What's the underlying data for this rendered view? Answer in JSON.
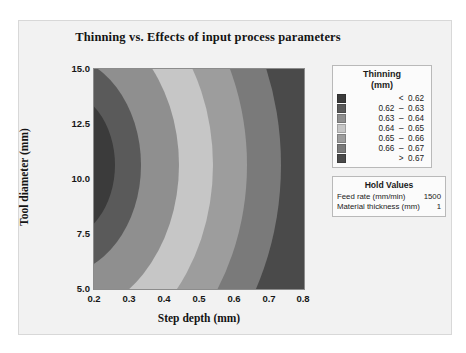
{
  "chart_data": {
    "type": "heatmap",
    "subtype": "filled-contour",
    "title": "Thinning vs. Effects of input process parameters",
    "xlabel": "Step depth (mm)",
    "ylabel": "Tool diameter (mm)",
    "xlim": [
      0.2,
      0.8
    ],
    "ylim": [
      5.0,
      15.0
    ],
    "xticks": [
      "0.2",
      "0.3",
      "0.4",
      "0.5",
      "0.6",
      "0.7",
      "0.8"
    ],
    "yticks": [
      "5.0",
      "7.5",
      "10.0",
      "12.5",
      "15.0"
    ],
    "grid": false,
    "legend_position": "right",
    "response": "Thinning",
    "response_unit": "(mm)",
    "levels": [
      {
        "label": "<  0.62",
        "range": [
          null,
          0.62
        ],
        "color": "#3b3b3b"
      },
      {
        "label": "0.62  –  0.63",
        "range": [
          0.62,
          0.63
        ],
        "color": "#5a5a5a"
      },
      {
        "label": "0.63  –  0.64",
        "range": [
          0.63,
          0.64
        ],
        "color": "#8f8f8f"
      },
      {
        "label": "0.64  –  0.65",
        "range": [
          0.64,
          0.65
        ],
        "color": "#c6c6c6"
      },
      {
        "label": "0.65  –  0.66",
        "range": [
          0.65,
          0.66
        ],
        "color": "#9d9d9d"
      },
      {
        "label": "0.66  –  0.67",
        "range": [
          0.66,
          0.67
        ],
        "color": "#7a7a7a"
      },
      {
        "label": ">  0.67",
        "range": [
          0.67,
          null
        ],
        "color": "#4a4a4a"
      }
    ],
    "contour_description": "Nested arc-shaped bands opening to the right; thinning is lowest in the upper-left region near step depth 0.2 and tool diameter 12.5-15.0, increasing toward the right edge at step depth 0.8.",
    "band_boundaries_at_mid_y": [
      0.255,
      0.33,
      0.45,
      0.545,
      0.645,
      0.735
    ]
  },
  "hold_values": {
    "title": "Hold Values",
    "rows": [
      {
        "name": "Feed rate (mm/min)",
        "value": "1500"
      },
      {
        "name": "Material thickness (mm)",
        "value": "1"
      }
    ]
  },
  "legend": {
    "title": "Thinning",
    "unit": "(mm)"
  }
}
